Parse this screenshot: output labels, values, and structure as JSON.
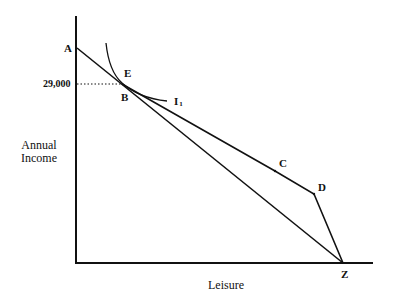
{
  "diagram": {
    "y_axis_label_line1": "Annual",
    "y_axis_label_line2": "Income",
    "x_axis_label": "Leisure",
    "y_tick_label": "29,000",
    "points": {
      "A": "A",
      "B": "B",
      "C": "C",
      "D": "D",
      "E": "E",
      "Z": "Z"
    },
    "indifference_curve": {
      "label": "I",
      "subscript": "1"
    },
    "colors": {
      "line": "#111111",
      "background": "#ffffff"
    }
  }
}
